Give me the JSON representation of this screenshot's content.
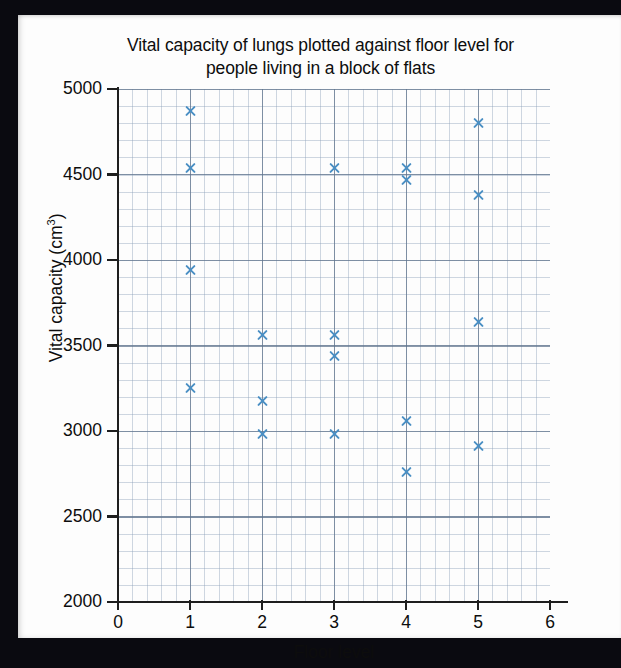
{
  "figure": {
    "title": "Vital capacity of lungs plotted against floor level for people living in a block of flats",
    "title_line1": "Vital capacity of lungs plotted against floor level for",
    "title_line2": "people living in a block of flats",
    "x_axis_title": "Floor level",
    "y_axis_title": "Vital capacity (cm",
    "y_axis_title_sup": "3",
    "y_axis_title_close": ")",
    "marker_color": "#4a8fc4",
    "grid_minor_color": "#8ca0b9",
    "grid_major_color": "#5f738c",
    "axis_color": "#1e1e1e",
    "paper_color": "#fdfdfd",
    "border_color": "#0a0a10"
  },
  "chart_data": {
    "type": "scatter",
    "title": "Vital capacity of lungs plotted against floor level for people living in a block of flats",
    "xlabel": "Floor level",
    "ylabel": "Vital capacity (cm3)",
    "xlim": [
      0,
      6
    ],
    "ylim": [
      2000,
      5000
    ],
    "x_ticks": [
      0,
      1,
      2,
      3,
      4,
      5,
      6
    ],
    "y_ticks": [
      2000,
      2500,
      3000,
      3500,
      4000,
      4500,
      5000
    ],
    "x_tick_labels": [
      "0",
      "1",
      "2",
      "3",
      "4",
      "5",
      "6"
    ],
    "y_tick_labels": [
      "2000",
      "2500",
      "3000",
      "3500",
      "4000",
      "4500",
      "5000"
    ],
    "grid": true,
    "grid_minor": true,
    "legend": false,
    "marker": "x",
    "marker_color": "#4a8fc4",
    "points": [
      {
        "x": 1,
        "y": 4870
      },
      {
        "x": 1,
        "y": 4540
      },
      {
        "x": 1,
        "y": 3940
      },
      {
        "x": 1,
        "y": 3250
      },
      {
        "x": 2,
        "y": 3560
      },
      {
        "x": 2,
        "y": 3175
      },
      {
        "x": 2,
        "y": 2985
      },
      {
        "x": 3,
        "y": 4540
      },
      {
        "x": 3,
        "y": 3560
      },
      {
        "x": 3,
        "y": 3440
      },
      {
        "x": 3,
        "y": 2985
      },
      {
        "x": 4,
        "y": 4540
      },
      {
        "x": 4,
        "y": 4470
      },
      {
        "x": 4,
        "y": 3060
      },
      {
        "x": 4,
        "y": 2760
      },
      {
        "x": 5,
        "y": 4800
      },
      {
        "x": 5,
        "y": 4380
      },
      {
        "x": 5,
        "y": 3640
      },
      {
        "x": 5,
        "y": 2910
      }
    ]
  }
}
